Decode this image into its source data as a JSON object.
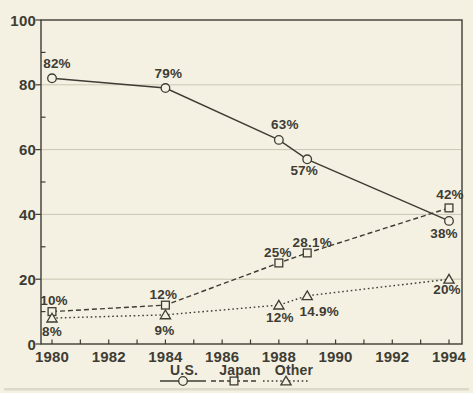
{
  "figure": {
    "background_color": "#f4f1e3",
    "ink_color": "#3e3c33",
    "grid_color": "#c9c6b3",
    "scan_shadow_color": "#d6d3c2"
  },
  "chart_data": {
    "type": "line",
    "x": [
      1980,
      1984,
      1988,
      1989,
      1994
    ],
    "series": [
      {
        "name": "U.S.",
        "marker": "circle",
        "line_style": "solid",
        "values": [
          82,
          79,
          63,
          57,
          38
        ],
        "point_labels": [
          "82%",
          "79%",
          "63%",
          "57%",
          "38%"
        ]
      },
      {
        "name": "Japan",
        "marker": "square",
        "line_style": "dashed",
        "values": [
          10,
          12,
          25,
          28.1,
          42
        ],
        "point_labels": [
          "10%",
          "12%",
          "25%",
          "28.1%",
          "42%"
        ]
      },
      {
        "name": "Other",
        "marker": "triangle",
        "line_style": "dotted",
        "values": [
          8,
          9,
          12,
          14.9,
          20
        ],
        "point_labels": [
          "8%",
          "9%",
          "12%",
          "14.9%",
          "20%"
        ]
      }
    ],
    "xlim": [
      1980,
      1994
    ],
    "ylim": [
      0,
      100
    ],
    "x_major_tick_labels": [
      "1980",
      "1982",
      "1984",
      "1986",
      "1988",
      "1990",
      "1992",
      "1994"
    ],
    "x_major_tick_years": [
      1980,
      1982,
      1984,
      1986,
      1988,
      1990,
      1992,
      1994
    ],
    "x_minor_tick_step_years": 1,
    "y_major_tick_labels": [
      "0",
      "20",
      "40",
      "60",
      "80",
      "100"
    ],
    "y_major_tick_values": [
      0,
      20,
      40,
      60,
      80,
      100
    ],
    "y_minor_tick_values": [
      10,
      30,
      50,
      70,
      90
    ],
    "grid": "horizontal-major-only",
    "legend_position": "bottom-center"
  }
}
